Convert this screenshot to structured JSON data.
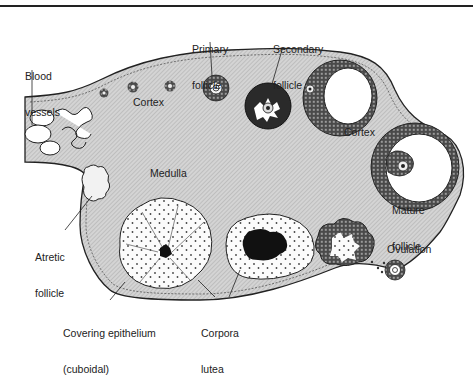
{
  "figure": {
    "colors": {
      "stroma": "#c9c9c9",
      "outline": "#222222",
      "granulosa": "#3a3a3a",
      "background": "#ffffff"
    }
  },
  "labels": {
    "blood_vessels": [
      "Blood",
      "vessels"
    ],
    "primary_follicle": [
      "Primary",
      "follicle"
    ],
    "secondary_follicle": [
      "Secondary",
      "follicle"
    ],
    "cortex_left": "Cortex",
    "cortex_right": "Cortex",
    "medulla": "Medulla",
    "atretic_follicle": [
      "Atretic",
      "follicle"
    ],
    "mature_follicle": [
      "Mature",
      "follicle"
    ],
    "ovulation": "Ovulation",
    "covering_epithelium": [
      "Covering epithelium",
      "(cuboidal)"
    ],
    "corpora_lutea": [
      "Corpora",
      "lutea"
    ]
  }
}
